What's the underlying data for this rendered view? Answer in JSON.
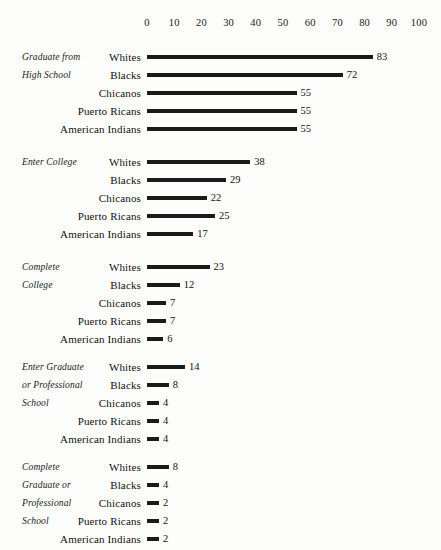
{
  "chart_data": {
    "type": "bar",
    "orientation": "horizontal",
    "title": "",
    "subtitle": "",
    "xlabel": "",
    "ylabel": "",
    "xlim": [
      0,
      100
    ],
    "xticks": [
      0,
      10,
      20,
      30,
      40,
      50,
      60,
      70,
      80,
      90,
      100
    ],
    "grid": false,
    "legend": false,
    "units": "percent",
    "categories": [
      "Whites",
      "Blacks",
      "Chicanos",
      "Puerto Ricans",
      "American Indians"
    ],
    "groups": [
      {
        "label": "Graduate from High School",
        "label_lines": [
          "Graduate from",
          "High School"
        ],
        "values": [
          83,
          72,
          55,
          55,
          55
        ],
        "rows": [
          {
            "category": "Whites",
            "value": 83,
            "value_label": "83"
          },
          {
            "category": "Blacks",
            "value": 72,
            "value_label": "72"
          },
          {
            "category": "Chicanos",
            "value": 55,
            "value_label": "55"
          },
          {
            "category": "Puerto Ricans",
            "value": 55,
            "value_label": "55"
          },
          {
            "category": "American Indians",
            "value": 55,
            "value_label": "55"
          }
        ]
      },
      {
        "label": "Enter College",
        "label_lines": [
          "Enter College"
        ],
        "values": [
          38,
          29,
          22,
          25,
          17
        ],
        "rows": [
          {
            "category": "Whites",
            "value": 38,
            "value_label": "38"
          },
          {
            "category": "Blacks",
            "value": 29,
            "value_label": "29"
          },
          {
            "category": "Chicanos",
            "value": 22,
            "value_label": "22"
          },
          {
            "category": "Puerto Ricans",
            "value": 25,
            "value_label": "25"
          },
          {
            "category": "American Indians",
            "value": 17,
            "value_label": "17"
          }
        ]
      },
      {
        "label": "Complete College",
        "label_lines": [
          "Complete",
          "College"
        ],
        "values": [
          23,
          12,
          7,
          7,
          6
        ],
        "rows": [
          {
            "category": "Whites",
            "value": 23,
            "value_label": "23"
          },
          {
            "category": "Blacks",
            "value": 12,
            "value_label": "12"
          },
          {
            "category": "Chicanos",
            "value": 7,
            "value_label": "7"
          },
          {
            "category": "Puerto Ricans",
            "value": 7,
            "value_label": "7"
          },
          {
            "category": "American Indians",
            "value": 6,
            "value_label": "6"
          }
        ]
      },
      {
        "label": "Enter Graduate or Professional School",
        "label_lines": [
          "Enter Graduate",
          "or Professional",
          "School"
        ],
        "values": [
          14,
          8,
          4,
          4,
          4
        ],
        "rows": [
          {
            "category": "Whites",
            "value": 14,
            "value_label": "14"
          },
          {
            "category": "Blacks",
            "value": 8,
            "value_label": "8"
          },
          {
            "category": "Chicanos",
            "value": 4,
            "value_label": "4"
          },
          {
            "category": "Puerto Ricans",
            "value": 4,
            "value_label": "4"
          },
          {
            "category": "American Indians",
            "value": 4,
            "value_label": "4"
          }
        ]
      },
      {
        "label": "Complete Graduate or Professional School",
        "label_lines": [
          "Complete",
          "Graduate or",
          "Professional",
          "School"
        ],
        "values": [
          8,
          4,
          2,
          2,
          2
        ],
        "rows": [
          {
            "category": "Whites",
            "value": 8,
            "value_label": "8"
          },
          {
            "category": "Blacks",
            "value": 4,
            "value_label": "4"
          },
          {
            "category": "Chicanos",
            "value": 2,
            "value_label": "2"
          },
          {
            "category": "Puerto Ricans",
            "value": 2,
            "value_label": "2"
          },
          {
            "category": "American Indians",
            "value": 2,
            "value_label": "2"
          }
        ]
      }
    ]
  },
  "style": {
    "bar_color": "#1b1b1b",
    "text_color": "#111111",
    "background": "#fdfdfc"
  },
  "layout": {
    "axis_y": 17,
    "origin_x": 147,
    "px_per_unit": 2.72,
    "row_height": 18,
    "label_right_x": 141,
    "min_bar_px": 12,
    "group_tops": [
      48,
      153,
      258,
      358,
      458
    ]
  }
}
